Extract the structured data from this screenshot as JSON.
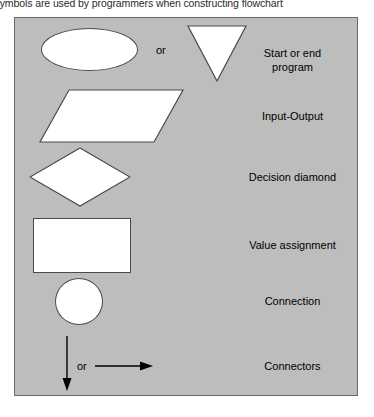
{
  "caption": {
    "text": "e symbols are used by programmers when constructing flowchart"
  },
  "colors": {
    "panel_background": "#bdbdbd",
    "panel_border": "#6a6a6a",
    "shape_fill": "#ffffff",
    "shape_stroke": "#4a4a4a",
    "text": "#000000"
  },
  "figure": {
    "rows": [
      {
        "id": "start-end",
        "shapes": [
          "ellipse",
          "triangle"
        ],
        "connector_word": "or",
        "label": "Start or end\nprogram"
      },
      {
        "id": "input-output",
        "shapes": [
          "parallelogram"
        ],
        "connector_word": "",
        "label": "Input-Output"
      },
      {
        "id": "decision",
        "shapes": [
          "diamond"
        ],
        "connector_word": "",
        "label": "Decision diamond"
      },
      {
        "id": "value-assignment",
        "shapes": [
          "rectangle"
        ],
        "connector_word": "",
        "label": "Value assignment"
      },
      {
        "id": "connection",
        "shapes": [
          "circle"
        ],
        "connector_word": "",
        "label": "Connection"
      },
      {
        "id": "connectors",
        "shapes": [
          "arrow-down",
          "arrow-right"
        ],
        "connector_word": "or",
        "label": "Connectors"
      }
    ]
  }
}
